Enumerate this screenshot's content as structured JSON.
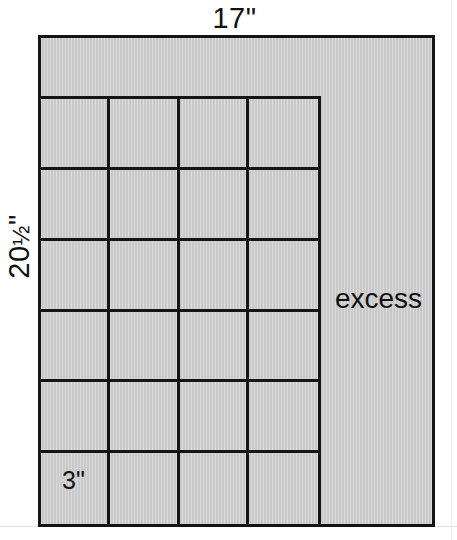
{
  "figure": {
    "shape_type": "rectangle",
    "fill_color": "#c9c9c9",
    "line_color": "#141414",
    "background_color": "#ffffff"
  },
  "labels": {
    "top_dimension": "17\"",
    "left_dimension_whole": "20",
    "left_dimension_fraction": "½",
    "left_dimension_unit": "\"",
    "left_dimension_full": "20½\"",
    "excess_region": "excess",
    "square_size": "3\""
  },
  "grid": {
    "columns": 4,
    "rows": 6,
    "square_label": "3\"",
    "cell_count": 24,
    "cells": [
      [
        "",
        "",
        "",
        ""
      ],
      [
        "",
        "",
        "",
        ""
      ],
      [
        "",
        "",
        "",
        ""
      ],
      [
        "",
        "",
        "",
        ""
      ],
      [
        "",
        "",
        "",
        ""
      ],
      [
        "3\"",
        "",
        "",
        ""
      ]
    ]
  },
  "chart_data": {
    "type": "diagram",
    "overall_width_inches": 17,
    "overall_height_inches": 20.5,
    "square_side_inches": 3,
    "squares_across": 4,
    "squares_down": 6,
    "total_squares": 24,
    "used_width_inches": 12,
    "used_height_inches": 18,
    "excess_width_inches": 5,
    "excess_height_inches": 2.5,
    "annotations": [
      "17\"",
      "20½\"",
      "excess",
      "3\""
    ]
  }
}
